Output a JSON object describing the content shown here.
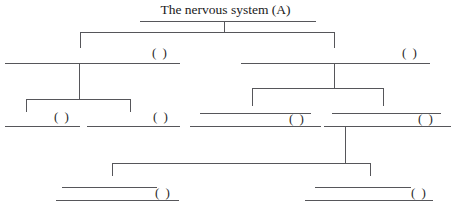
{
  "title": {
    "text": "The nervous system (A)",
    "underline": {
      "x1": 140,
      "x2": 316,
      "y": 21
    }
  },
  "colors": {
    "background": "#ffffff",
    "line": "#56565a",
    "text": "#1a1a1a"
  },
  "blank_marker": "( )",
  "nodes": [
    {
      "id": "level1-left",
      "label": "( )",
      "blank_style": "single",
      "lines": [
        {
          "x1": 5,
          "x2": 180,
          "y": 63
        }
      ],
      "paren": {
        "x": 152,
        "y": 46
      }
    },
    {
      "id": "level1-right",
      "label": "( )",
      "blank_style": "single",
      "lines": [
        {
          "x1": 241,
          "x2": 430,
          "y": 63
        }
      ],
      "paren": {
        "x": 402,
        "y": 46
      }
    },
    {
      "id": "level2-left-a",
      "label": "( )",
      "blank_style": "single",
      "lines": [
        {
          "x1": 5,
          "x2": 80,
          "y": 126
        }
      ],
      "paren": {
        "x": 54,
        "y": 110
      }
    },
    {
      "id": "level2-left-b",
      "label": "( )",
      "blank_style": "single",
      "lines": [
        {
          "x1": 87,
          "x2": 180,
          "y": 126
        }
      ],
      "paren": {
        "x": 153,
        "y": 110
      }
    },
    {
      "id": "level2-right-a",
      "label": "( )",
      "blank_style": "double",
      "lines": [
        {
          "x1": 200,
          "x2": 311,
          "y": 113
        },
        {
          "x1": 190,
          "x2": 321,
          "y": 126
        }
      ],
      "paren": {
        "x": 289,
        "y": 112
      }
    },
    {
      "id": "level2-right-b",
      "label": "( )",
      "blank_style": "double",
      "lines": [
        {
          "x1": 332,
          "x2": 441,
          "y": 113
        },
        {
          "x1": 324,
          "x2": 451,
          "y": 126
        }
      ],
      "paren": {
        "x": 418,
        "y": 112
      }
    },
    {
      "id": "level3-left",
      "label": "( )",
      "blank_style": "double",
      "lines": [
        {
          "x1": 62,
          "x2": 157,
          "y": 187
        },
        {
          "x1": 56,
          "x2": 179,
          "y": 200
        }
      ],
      "paren": {
        "x": 155,
        "y": 186
      }
    },
    {
      "id": "level3-right",
      "label": "( )",
      "blank_style": "double",
      "lines": [
        {
          "x1": 315,
          "x2": 411,
          "y": 187
        },
        {
          "x1": 305,
          "x2": 433,
          "y": 200
        }
      ],
      "paren": {
        "x": 411,
        "y": 186
      }
    }
  ],
  "connectors": [
    {
      "id": "root-stem",
      "type": "vertical",
      "x": 224,
      "y1": 22,
      "y2": 32
    },
    {
      "id": "root-bar",
      "type": "horizontal",
      "x1": 80,
      "x2": 334,
      "y": 32
    },
    {
      "id": "root-drop-left",
      "type": "vertical",
      "x": 80,
      "y1": 32,
      "y2": 48
    },
    {
      "id": "root-drop-right",
      "type": "vertical",
      "x": 334,
      "y1": 32,
      "y2": 48
    },
    {
      "id": "left-stem",
      "type": "vertical",
      "x": 79,
      "y1": 63,
      "y2": 99
    },
    {
      "id": "left-bar",
      "type": "horizontal",
      "x1": 26,
      "x2": 130,
      "y": 99
    },
    {
      "id": "left-drop-a",
      "type": "vertical",
      "x": 26,
      "y1": 99,
      "y2": 112
    },
    {
      "id": "left-drop-b",
      "type": "vertical",
      "x": 130,
      "y1": 99,
      "y2": 112
    },
    {
      "id": "right-stem",
      "type": "vertical",
      "x": 334,
      "y1": 63,
      "y2": 88
    },
    {
      "id": "right-bar",
      "type": "horizontal",
      "x1": 252,
      "x2": 383,
      "y": 88
    },
    {
      "id": "right-drop-a",
      "type": "vertical",
      "x": 252,
      "y1": 88,
      "y2": 106
    },
    {
      "id": "right-drop-b",
      "type": "vertical",
      "x": 383,
      "y1": 88,
      "y2": 106
    },
    {
      "id": "bottom-stem",
      "type": "vertical",
      "x": 345,
      "y1": 126,
      "y2": 163
    },
    {
      "id": "bottom-bar",
      "type": "horizontal",
      "x1": 112,
      "x2": 370,
      "y": 163
    },
    {
      "id": "bottom-drop-left",
      "type": "vertical",
      "x": 112,
      "y1": 163,
      "y2": 176
    },
    {
      "id": "bottom-drop-right",
      "type": "vertical",
      "x": 370,
      "y1": 163,
      "y2": 176
    }
  ]
}
